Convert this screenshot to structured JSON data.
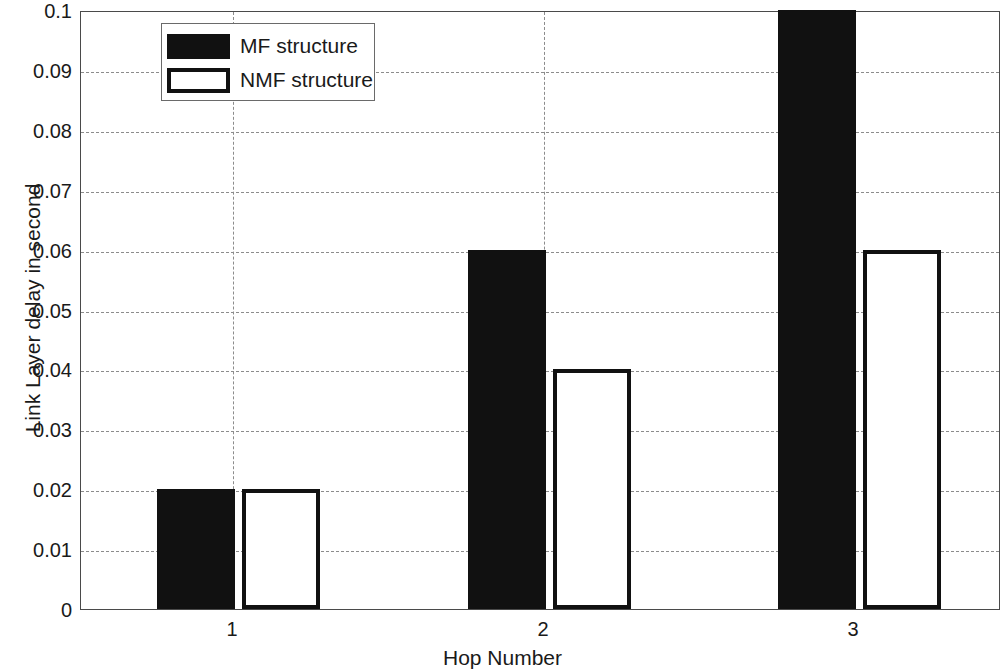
{
  "chart_data": {
    "type": "bar",
    "title": "",
    "subtitle": "",
    "xlabel": "Hop Number",
    "ylabel": "Link Layer delay in second",
    "categories": [
      "1",
      "2",
      "3"
    ],
    "series": [
      {
        "name": "MF structure",
        "values": [
          0.02,
          0.06,
          0.1
        ],
        "fill": "#111111",
        "style": "filled"
      },
      {
        "name": "NMF structure",
        "values": [
          0.02,
          0.04,
          0.06
        ],
        "fill": "#ffffff",
        "style": "outlined"
      }
    ],
    "ylim": [
      0,
      0.1
    ],
    "yticks": [
      0,
      0.01,
      0.02,
      0.03,
      0.04,
      0.05,
      0.06,
      0.07,
      0.08,
      0.09,
      0.1
    ],
    "ytick_labels": [
      "0",
      "0.01",
      "0.02",
      "0.03",
      "0.04",
      "0.05",
      "0.06",
      "0.07",
      "0.08",
      "0.09",
      "0.1"
    ],
    "xtick_labels": [
      "1",
      "2",
      "3"
    ],
    "grid": true,
    "grid_style": "dashed",
    "grid_color": "#8c8c8c",
    "legend_position": "upper-left",
    "axis_color": "#4a4a4a",
    "background": "#ffffff"
  },
  "axes": {
    "y_title": "Link Layer delay in second",
    "x_title": "Hop Number",
    "y_tick_0": "0",
    "y_tick_1": "0.01",
    "y_tick_2": "0.02",
    "y_tick_3": "0.03",
    "y_tick_4": "0.04",
    "y_tick_5": "0.05",
    "y_tick_6": "0.06",
    "y_tick_7": "0.07",
    "y_tick_8": "0.08",
    "y_tick_9": "0.09",
    "y_tick_10": "0.1",
    "x_tick_1": "1",
    "x_tick_2": "2",
    "x_tick_3": "3"
  },
  "legend": {
    "items": [
      {
        "label": "MF structure"
      },
      {
        "label": "NMF structure"
      }
    ]
  }
}
